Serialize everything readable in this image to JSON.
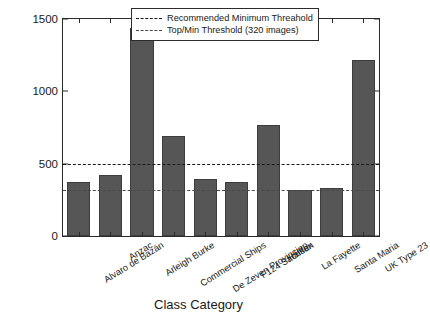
{
  "chart_data": {
    "type": "bar",
    "title": "",
    "xlabel": "Class Category",
    "ylabel": "No of Images",
    "categories": [
      "Alvaro de Bazán",
      "Anzac",
      "Arleigh Burke",
      "Commercial Ships",
      "De Zeven Provincien",
      "F124 Sachsen",
      "Halifax",
      "La Fayette",
      "Santa Maria",
      "UK Type 23"
    ],
    "values": [
      370,
      425,
      1440,
      690,
      395,
      375,
      770,
      315,
      335,
      1220
    ],
    "ylim": [
      0,
      1500
    ],
    "yticks": [
      0,
      500,
      1000,
      1500
    ],
    "ytick_labels": [
      "0",
      "500",
      "1000",
      "1500"
    ],
    "grid": false,
    "bar_color": "#565656",
    "legend_position": "top-right",
    "annotations": [
      {
        "name": "recommended-minimum-threshold",
        "label": "Recommended Minimum Threahold",
        "value": 500,
        "style": "thick",
        "color": "#1a1a1a"
      },
      {
        "name": "top-min-threshold",
        "label": "Top/Min Threshold (320 images)",
        "value": 320,
        "style": "thin",
        "color": "#4a4a4a"
      }
    ]
  },
  "legend": {
    "items": [
      {
        "label": "Recommended Minimum Threahold"
      },
      {
        "label": "Top/Min Threshold (320 images)"
      }
    ]
  },
  "axes": {
    "y_title": "No of Images",
    "x_title": "Class Category"
  }
}
